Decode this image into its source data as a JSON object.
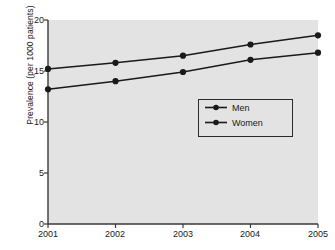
{
  "chart_data": {
    "type": "line",
    "title": "",
    "xlabel": "",
    "ylabel": "Prevalence (per 1000 patients)",
    "categories": [
      "2001",
      "2002",
      "2003",
      "2004",
      "2005"
    ],
    "x": [
      2001,
      2002,
      2003,
      2004,
      2005
    ],
    "xlim": [
      2001,
      2005
    ],
    "ylim": [
      0,
      20
    ],
    "yticks": [
      0,
      5,
      10,
      15,
      20
    ],
    "ytick_labels": [
      "0",
      "5",
      "10",
      "15",
      "20"
    ],
    "xtick_labels": [
      "2001",
      "2002",
      "2003",
      "2004",
      "2005"
    ],
    "grid": false,
    "legend_position": "center-right",
    "plot_background": "#e3e3e3",
    "series": [
      {
        "name": "Men",
        "values": [
          15.2,
          15.8,
          16.5,
          17.6,
          18.5
        ],
        "color": "#1a1a1a",
        "marker": "circle"
      },
      {
        "name": "Women",
        "values": [
          13.2,
          14.0,
          14.9,
          16.1,
          16.8
        ],
        "color": "#1a1a1a",
        "marker": "circle"
      }
    ],
    "legend": [
      {
        "label": "Men"
      },
      {
        "label": "Women"
      }
    ]
  }
}
